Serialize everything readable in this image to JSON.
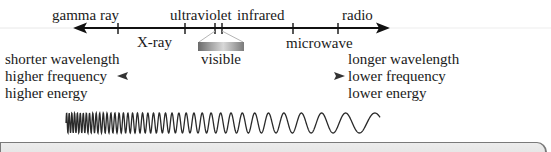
{
  "diagram": {
    "spectrum_axis": {
      "top_labels": [
        {
          "text": "gamma ray",
          "x": 52
        },
        {
          "text": "ultraviolet",
          "x": 170
        },
        {
          "text": "infrared",
          "x": 237
        },
        {
          "text": "radio",
          "x": 342
        }
      ],
      "bottom_labels": [
        {
          "text": "X-ray",
          "x": 137
        },
        {
          "text": "microwave",
          "x": 286
        }
      ],
      "tick_positions": [
        118,
        185,
        215,
        222,
        293,
        338
      ]
    },
    "visible_band": {
      "label": "visible"
    },
    "left_properties": [
      "shorter wavelength",
      "higher frequency",
      "higher energy"
    ],
    "right_properties": [
      "longer wavelength",
      "lower frequency",
      "lower energy"
    ],
    "colors": {
      "axis": "#111111",
      "middle_arrow": "#555555",
      "wave": "#2a2a2a",
      "bottom_box_fill": "#e6e6e6",
      "bottom_box_border": "#7a7a7a"
    }
  }
}
